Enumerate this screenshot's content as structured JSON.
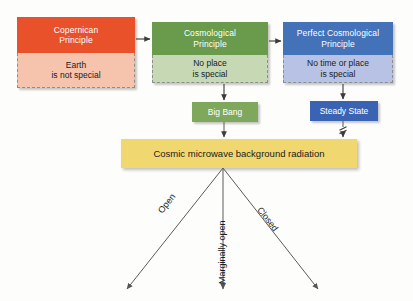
{
  "diagram": {
    "background_color": "#fdfdfc"
  },
  "principles": [
    {
      "id": "copernican",
      "header": "Copernican\nPrinciple",
      "header_line1": "Copernican",
      "header_line2": "Principle",
      "body_line1": "Earth",
      "body_line2": "is not special",
      "header_color": "#e8512a",
      "body_color": "#f6c3ac"
    },
    {
      "id": "cosmological",
      "header_line1": "Cosmological",
      "header_line2": "Principle",
      "body_line1": "No place",
      "body_line2": "is special",
      "header_color": "#6a9a4b",
      "body_color": "#c6d9b4"
    },
    {
      "id": "perfect-cosmological",
      "header_line1": "Perfect Cosmological",
      "header_line2": "Principle",
      "body_line1": "No time or place",
      "body_line2": "is special",
      "header_color": "#4472b8",
      "body_color": "#b8c2e4"
    }
  ],
  "models": [
    {
      "id": "big-bang",
      "label": "Big Bang",
      "color": "#7fa85c"
    },
    {
      "id": "steady-state",
      "label": "Steady State",
      "color": "#3a63b4"
    }
  ],
  "evidence": {
    "id": "cmb",
    "label": "Cosmic microwave background radiation",
    "color": "#f0d770"
  },
  "outcomes": [
    {
      "id": "open",
      "label": "Open"
    },
    {
      "id": "marginally-open",
      "label": "Marginally open"
    },
    {
      "id": "closed",
      "label": "Closed"
    }
  ],
  "markers": {
    "break_symbol": "break-mark"
  }
}
